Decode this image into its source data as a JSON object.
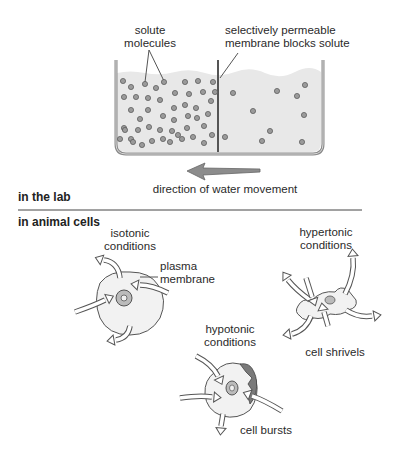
{
  "lab": {
    "section_label": "in the lab",
    "solute_label": [
      "solute",
      "molecules"
    ],
    "membrane_label": [
      "selectively permeable",
      "membrane blocks solute"
    ],
    "arrow_label": "direction of water movement",
    "left_side_molecule_count": 48,
    "right_side_molecule_count": 10
  },
  "cells": {
    "section_label": "in animal cells",
    "isotonic": {
      "condition_label": [
        "isotonic",
        "conditions"
      ],
      "membrane_label": [
        "plasma",
        "membrane"
      ]
    },
    "hypertonic": {
      "condition_label": [
        "hypertonic",
        "conditions"
      ],
      "result_label": "cell shrivels"
    },
    "hypotonic": {
      "condition_label": [
        "hypotonic",
        "conditions"
      ],
      "result_label": "cell bursts"
    }
  },
  "colors": {
    "water": "#e6e6e6",
    "container": "#8a8a8a",
    "molecule": "#9a9a9a",
    "arrow": "#8c8c8c",
    "cell": "#efefef",
    "burst": "#7a7a7a"
  }
}
